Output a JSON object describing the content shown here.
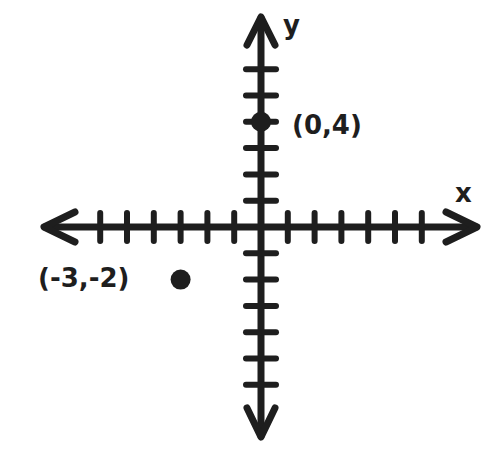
{
  "chart_data": {
    "type": "scatter",
    "title": "",
    "xlabel": "x",
    "ylabel": "y",
    "xlim": [
      -8,
      8
    ],
    "ylim": [
      -7,
      8
    ],
    "grid": false,
    "x_ticks_each_side": 6,
    "y_ticks_up": 6,
    "y_ticks_down": 6,
    "points": [
      {
        "x": 0,
        "y": 4,
        "label": "(0,4)"
      },
      {
        "x": -3,
        "y": -2,
        "label": "(-3,-2)"
      }
    ]
  },
  "colors": {
    "ink": "#1e1e1e",
    "background": "#ffffff"
  }
}
